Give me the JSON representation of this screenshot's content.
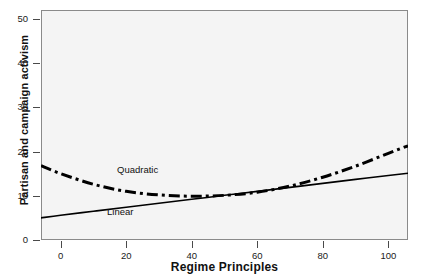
{
  "chart_data": {
    "type": "line",
    "title": "",
    "subtitle": "",
    "xlabel": "Regime Principles",
    "ylabel": "Partisan and campaign activism",
    "xlim": [
      -6,
      106
    ],
    "ylim": [
      0,
      52
    ],
    "xticks": [
      0,
      20,
      40,
      60,
      80,
      100
    ],
    "xtick_labels": [
      "0",
      "20",
      "40",
      "60",
      "80",
      "100"
    ],
    "yticks": [
      0,
      10,
      20,
      30,
      40,
      50
    ],
    "ytick_labels": [
      "0",
      "10",
      "20",
      "30",
      "40",
      "50"
    ],
    "grid": false,
    "legend": "inline-annotation",
    "background": "#f4f4f4",
    "series": [
      {
        "name": "Linear",
        "style": "solid",
        "color": "#000000",
        "annotation": "Linear",
        "x": [
          -6,
          0,
          10,
          20,
          30,
          40,
          50,
          60,
          70,
          80,
          90,
          100,
          106
        ],
        "values": [
          5.0,
          5.6,
          6.5,
          7.4,
          8.3,
          9.2,
          10.1,
          11.0,
          11.9,
          12.8,
          13.7,
          14.6,
          15.1
        ]
      },
      {
        "name": "Quadratic",
        "style": "dash-dot",
        "color": "#000000",
        "annotation": "Quadratic",
        "x": [
          -6,
          0,
          10,
          20,
          30,
          40,
          50,
          60,
          70,
          80,
          90,
          100,
          106
        ],
        "values": [
          16.8,
          15.0,
          12.6,
          11.0,
          10.2,
          9.9,
          10.1,
          10.8,
          12.2,
          14.2,
          16.7,
          19.6,
          21.3
        ]
      }
    ]
  },
  "axis": {
    "y_title": "Partisan and campaign activism",
    "x_title": "Regime Principles"
  },
  "annotations": {
    "quadratic": "Quadratic",
    "linear": "Linear"
  }
}
